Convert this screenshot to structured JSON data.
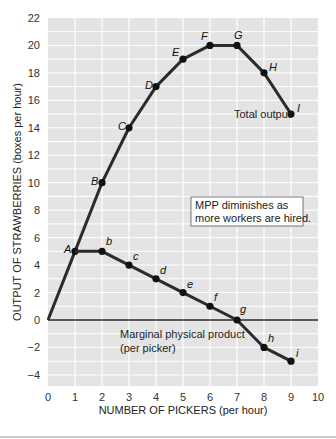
{
  "chart_data": {
    "type": "line",
    "title": "",
    "xlabel": "NUMBER OF PICKERS (per hour)",
    "ylabel": "OUTPUT OF STRAWBERRIES (boxes per hour)",
    "xlim": [
      0,
      10
    ],
    "ylim": [
      -4,
      22
    ],
    "x_ticks": [
      0,
      1,
      2,
      3,
      4,
      5,
      6,
      7,
      8,
      9,
      10
    ],
    "y_ticks": [
      22,
      20,
      18,
      16,
      14,
      12,
      10,
      8,
      6,
      4,
      2,
      0,
      -2,
      -4
    ],
    "y_tick_labels": [
      "22",
      "20",
      "18",
      "16",
      "14",
      "12",
      "10",
      "8",
      "6",
      "4",
      "2",
      "0",
      "−2",
      "−4"
    ],
    "grid": true,
    "series": [
      {
        "name": "Total output",
        "x": [
          0,
          1,
          2,
          3,
          4,
          5,
          6,
          7,
          8,
          9
        ],
        "values": [
          0,
          5,
          10,
          14,
          17,
          19,
          20,
          20,
          18,
          15
        ],
        "point_labels": [
          "",
          "A",
          "B",
          "C",
          "D",
          "E",
          "F",
          "G",
          "H",
          "I"
        ]
      },
      {
        "name": "Marginal physical product (per picker)",
        "x": [
          1,
          2,
          3,
          4,
          5,
          6,
          7,
          8,
          9
        ],
        "values": [
          5,
          5,
          4,
          3,
          2,
          1,
          0,
          -2,
          -3
        ],
        "point_labels": [
          "",
          "b",
          "c",
          "d",
          "e",
          "f",
          "g",
          "h",
          "i"
        ]
      }
    ],
    "annotations": [
      {
        "text": "Total output",
        "near": "I"
      },
      {
        "text": [
          "Marginal physical product",
          "(per picker)"
        ],
        "near": "MPP curve"
      },
      {
        "text": [
          "MPP diminishes as",
          "more workers are hired."
        ],
        "boxed": true
      }
    ]
  },
  "labels": {
    "xlabel": "NUMBER OF PICKERS (per hour)",
    "ylabel": "OUTPUT OF STRAWBERRIES (boxes per hour)",
    "total_output": "Total output",
    "mpp_line1": "Marginal physical product",
    "mpp_line2": "(per picker)",
    "note_line1": "MPP diminishes as",
    "note_line2": "more workers are hired."
  },
  "colors": {
    "plot_bg": "#e4e4e4",
    "grid": "#ffffff",
    "line": "#2b2b2b",
    "point": "#111111"
  }
}
